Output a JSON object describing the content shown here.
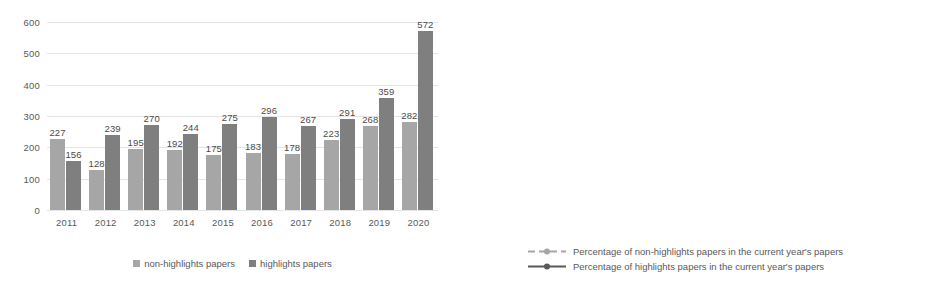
{
  "chart_data": [
    {
      "type": "bar",
      "title": "",
      "xlabel": "",
      "ylabel": "",
      "categories": [
        "2011",
        "2012",
        "2013",
        "2014",
        "2015",
        "2016",
        "2017",
        "2018",
        "2019",
        "2020"
      ],
      "series": [
        {
          "name": "non-highlights papers",
          "color": "#a6a6a6",
          "values": [
            227,
            128,
            195,
            192,
            175,
            183,
            178,
            223,
            268,
            282
          ]
        },
        {
          "name": "highlights papers",
          "color": "#7f7f7f",
          "values": [
            156,
            239,
            270,
            244,
            275,
            296,
            267,
            291,
            359,
            572
          ]
        }
      ],
      "ylim": [
        0,
        600
      ],
      "yticks": [
        0,
        100,
        200,
        300,
        400,
        500,
        600
      ],
      "ytick_labels": [
        "0",
        "100",
        "200",
        "300",
        "400",
        "500",
        "600"
      ],
      "grid": true,
      "legend_position": "bottom"
    },
    {
      "type": "line",
      "title": "",
      "xlabel": "",
      "ylabel": "",
      "categories": [
        "2011",
        "2012",
        "2013",
        "2014",
        "2015",
        "2016",
        "2017",
        "2018",
        "2019",
        "2020"
      ],
      "series": [
        {
          "name": "Percentage of non-highlights papers in the current year's papers",
          "color": "#a6a6a6",
          "style": "dashed",
          "values": [
            59,
            35,
            42,
            44,
            39,
            38,
            40,
            43,
            43,
            33
          ],
          "labels": [
            "59%",
            "35%",
            "42%",
            "44%",
            "39%",
            "38%",
            "40%",
            "43%",
            "43%",
            "33%"
          ]
        },
        {
          "name": "Percentage of highlights papers in the current year's papers",
          "color": "#595959",
          "style": "solid",
          "values": [
            41,
            65,
            58,
            56,
            61,
            62,
            60,
            57,
            57,
            67
          ],
          "labels": [
            "41%",
            "65%",
            "58%",
            "56%",
            "61%",
            "62%",
            "60%",
            "57%",
            "57%",
            "67%"
          ]
        }
      ],
      "ylim": [
        0,
        100
      ],
      "yticks": [
        0,
        10,
        20,
        30,
        40,
        50,
        60,
        70,
        80,
        90,
        100
      ],
      "ytick_labels": [
        "0%",
        "10%",
        "20%",
        "30%",
        "40%",
        "50%",
        "60%",
        "70%",
        "80%",
        "90%",
        "100%"
      ],
      "grid": true,
      "legend_position": "bottom"
    }
  ]
}
